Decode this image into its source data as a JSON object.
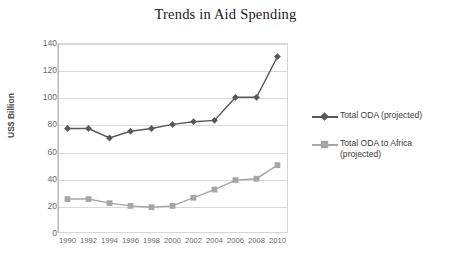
{
  "chart_data": {
    "type": "line",
    "title": "Trends in Aid Spending",
    "xlabel": "",
    "ylabel": "US$ Billion",
    "x": [
      1990,
      1992,
      1994,
      1996,
      1998,
      2000,
      2002,
      2004,
      2006,
      2008,
      2010
    ],
    "categories": [
      "1990",
      "1992",
      "1994",
      "1996",
      "1998",
      "2000",
      "2002",
      "2004",
      "2006",
      "2008",
      "2010"
    ],
    "xticklabels": [
      "1990",
      "1992",
      "1994",
      "1996",
      "1998",
      "2000",
      "2002",
      "2004",
      "2006",
      "2008",
      "2010"
    ],
    "yticklabels": [
      "0",
      "20",
      "40",
      "60",
      "80",
      "100",
      "120",
      "140"
    ],
    "yticks": [
      0,
      20,
      40,
      60,
      80,
      100,
      120,
      140
    ],
    "ylim": [
      0,
      140
    ],
    "grid": "horizontal",
    "legend_position": "right",
    "series": [
      {
        "name": "Total ODA (projected)",
        "marker": "diamond",
        "color": "#595959",
        "values": [
          77,
          77,
          70,
          75,
          77,
          80,
          82,
          83,
          100,
          100,
          130
        ]
      },
      {
        "name": "Total ODA to Africa (projected)",
        "marker": "square",
        "color": "#a6a6a6",
        "values": [
          25,
          25,
          22,
          20,
          19,
          20,
          26,
          32,
          39,
          40,
          50
        ]
      }
    ]
  },
  "legend": {
    "items": [
      {
        "label": "Total ODA (projected)",
        "color": "#595959",
        "marker": "diamond-marker"
      },
      {
        "label": "Total ODA to Africa (projected)",
        "color": "#a6a6a6",
        "marker": "square-marker"
      }
    ]
  },
  "colors": {
    "series_oda": "#595959",
    "series_africa": "#a6a6a6",
    "gridline": "#d9d9d9",
    "axis": "#bfbfbf",
    "tick_text": "#6b6b6b",
    "title_text": "#1a1a1a",
    "background": "#ffffff"
  }
}
